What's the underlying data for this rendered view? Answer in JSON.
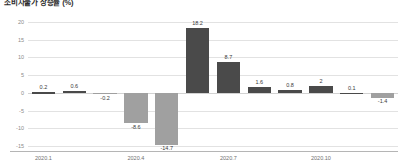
{
  "chart_data": {
    "type": "bar",
    "title": "소비자물가 상승률 (%)",
    "xlabel": "",
    "ylabel": "",
    "ylim": [
      -15,
      20
    ],
    "yticks": [
      20,
      15,
      10,
      5,
      0,
      -5,
      -10,
      -15
    ],
    "ytick_labels": [
      "20",
      "15",
      "10",
      "5",
      "0",
      "-5",
      "-10",
      "-15"
    ],
    "grid": true,
    "legend": "none",
    "categories": [
      "2020.1",
      "2020.2",
      "2020.3",
      "2020.4",
      "2020.5",
      "2020.6",
      "2020.7",
      "2020.8",
      "2020.9",
      "2020.10",
      "2020.11",
      "2020.12"
    ],
    "xtick_labels": [
      "2020.1",
      "2020.4",
      "2020.7",
      "2020.10"
    ],
    "xtick_indices": [
      0,
      3,
      6,
      9
    ],
    "values": [
      0.2,
      0.6,
      -0.2,
      -8.6,
      -14.7,
      18.2,
      8.7,
      1.6,
      0.8,
      2,
      0.1,
      -1.4
    ],
    "value_labels": [
      "0.2",
      "0.6",
      "-0.2",
      "-8.6",
      "-14.7",
      "18.2",
      "8.7",
      "1.6",
      "0.8",
      "2",
      "0.1",
      "-1.4"
    ],
    "colors": {
      "positive_bar": "#4a4a4a",
      "negative_bar": "#a0a0a0",
      "gridline": "#e2e2e2",
      "axis_line": "#b5b5b5",
      "tick_text": "#8a8a8a",
      "label_text": "#3a3a3a"
    }
  }
}
